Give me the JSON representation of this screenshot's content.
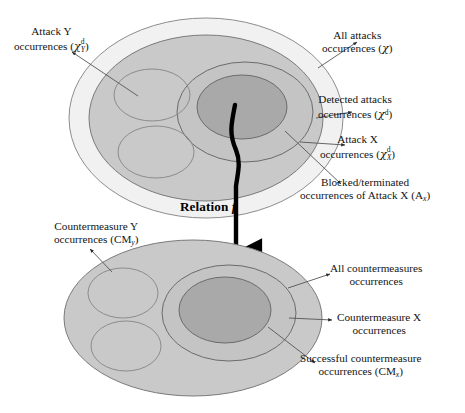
{
  "figure": {
    "relation_label_text": "Relation",
    "relation_label_symbol": "f"
  },
  "colors": {
    "outer_ring_fill": "#f1f1f1",
    "mid_grey_fill": "#c9c9c9",
    "ring_grey_fill": "#c4c4c4",
    "dark_core_fill": "#a9a9a9",
    "outline": "#6e6e6e",
    "arrow_black": "#000000",
    "leader_line": "#5a5a5a",
    "text": "#141414"
  },
  "top_diagram": {
    "name": "attacks-set-diagram",
    "sets": [
      {
        "id": "all-attacks",
        "label": "All attacks occurrences",
        "symbol": "χ"
      },
      {
        "id": "detected-attacks",
        "label": "Detected attacks occurrences",
        "symbol": "χ^d"
      },
      {
        "id": "attack-x",
        "label": "Attack X occurrences",
        "symbol": "χ^d_X"
      },
      {
        "id": "blocked-attack-x",
        "label": "Blocked/terminated occurrences of Attack X",
        "symbol": "A_x"
      },
      {
        "id": "attack-y",
        "label": "Attack Y occurrences",
        "symbol": "χ^d_Y"
      }
    ]
  },
  "bottom_diagram": {
    "name": "countermeasures-set-diagram",
    "sets": [
      {
        "id": "all-countermeasures",
        "label": "All countermeasures occurrences",
        "symbol": ""
      },
      {
        "id": "countermeasure-x",
        "label": "Countermeasure X occurrences",
        "symbol": ""
      },
      {
        "id": "successful-countermeasure",
        "label": "Successful countermeasure occurrences",
        "symbol": "CM_x"
      },
      {
        "id": "countermeasure-y",
        "label": "Countermeasure Y occurrences",
        "symbol": "CM_y"
      }
    ]
  },
  "labels": {
    "attack_y": {
      "line1": "Attack Y",
      "line2_prefix": "occurrences (",
      "line2_symbol_base": "χ",
      "line2_sup": "d",
      "line2_sub": "Y",
      "line2_suffix": ")"
    },
    "all_attacks": {
      "line1": "All attacks",
      "line2_prefix": "occurrences (",
      "line2_symbol_base": "χ",
      "line2_suffix": ")"
    },
    "detected_attacks": {
      "line1": "Detected attacks",
      "line2_prefix": "occurrences (",
      "line2_symbol_base": "χ",
      "line2_sup": "d",
      "line2_suffix": ")"
    },
    "attack_x": {
      "line1": "Attack X",
      "line2_prefix": "occurrences (",
      "line2_symbol_base": "χ",
      "line2_sup": "d",
      "line2_sub": "X",
      "line2_suffix": ")"
    },
    "blocked_attack_x": {
      "line1": "Blocked/terminated",
      "line2_prefix": "occurrences of Attack X (A",
      "line2_sub": "x",
      "line2_suffix": ")"
    },
    "countermeasure_y": {
      "line1": "Countermeasure Y",
      "line2_prefix": "occurrences (CM",
      "line2_sub": "y",
      "line2_suffix": ")"
    },
    "all_countermeasures": {
      "line1": "All countermeasures",
      "line2": "occurrences"
    },
    "countermeasure_x": {
      "line1": "Countermeasure X",
      "line2": "occurrences"
    },
    "successful_countermeasure": {
      "line1": "Successful countermeasure",
      "line2_prefix": "occurrences (CM",
      "line2_sub": "x",
      "line2_suffix": ")"
    }
  }
}
